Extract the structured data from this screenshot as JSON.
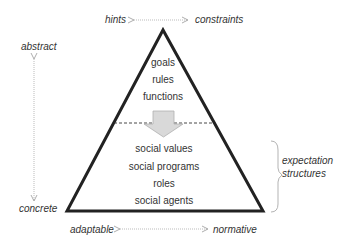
{
  "diagram": {
    "top_axis": {
      "left": "hints",
      "right": "constraints"
    },
    "left_axis": {
      "top": "abstract",
      "bottom": "concrete"
    },
    "bottom_axis": {
      "left": "adaptable",
      "right": "normative"
    },
    "upper_items": [
      "goals",
      "rules",
      "functions"
    ],
    "lower_items": [
      "social values",
      "social programs",
      "roles",
      "social agents"
    ],
    "brace_label": [
      "expectation",
      "structures"
    ],
    "colors": {
      "triangle": "#222222",
      "arrow_fill": "#d9d9d9",
      "arrow_stroke": "#aaaaaa",
      "axis": "#999999"
    }
  }
}
